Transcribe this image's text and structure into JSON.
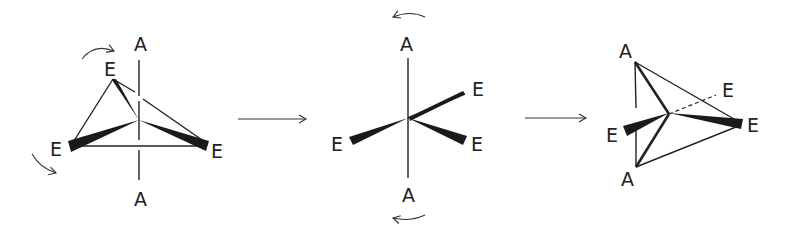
{
  "diagram": {
    "colors": {
      "ink": "#222222",
      "background": "#ffffff"
    },
    "step_arrows": [
      {
        "label": ""
      },
      {
        "label": ""
      }
    ],
    "structures": [
      {
        "name": "trigonal-bipyramid-initial",
        "labels": {
          "axial_top": "A",
          "axial_bottom": "A",
          "eq_top": "E",
          "eq_left": "E",
          "eq_right": "E"
        },
        "rotation_arrows": 2
      },
      {
        "name": "square-pyramid-transition",
        "labels": {
          "axial_top": "A",
          "axial_bottom": "A",
          "eq_upper_right": "E",
          "eq_left": "E",
          "eq_lower_right": "E"
        },
        "rotation_arrows": 2
      },
      {
        "name": "trigonal-bipyramid-final",
        "labels": {
          "axial_top": "A",
          "axial_bottom": "A",
          "eq_back": "E",
          "eq_left": "E",
          "eq_right": "E"
        },
        "rotation_arrows": 0
      }
    ]
  }
}
